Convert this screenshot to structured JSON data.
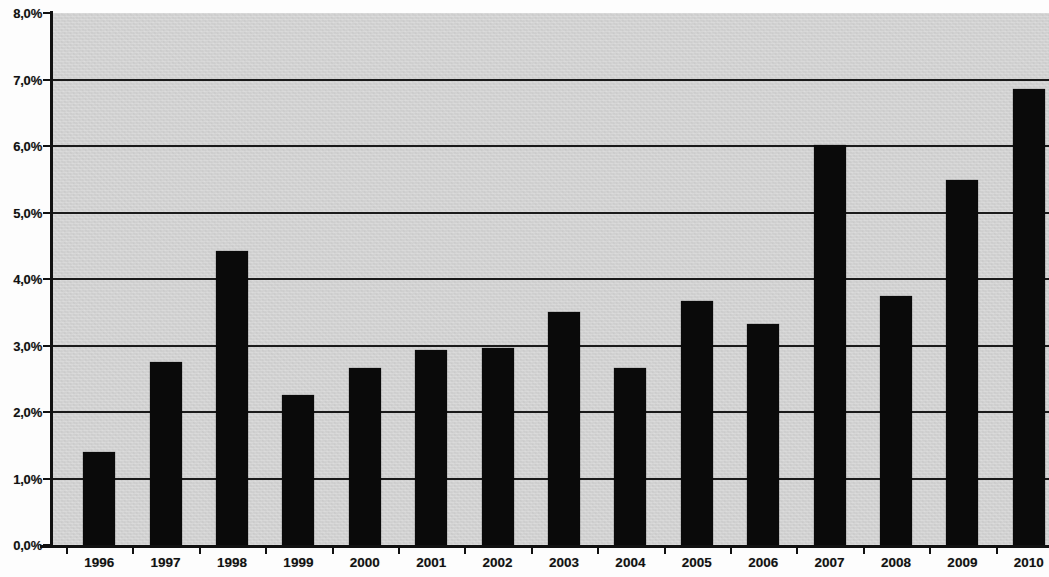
{
  "chart_data": {
    "type": "bar",
    "title": "",
    "subtitle": "",
    "xlabel": "",
    "ylabel": "",
    "categories": [
      "1996",
      "1997",
      "1998",
      "1999",
      "2000",
      "2001",
      "2002",
      "2003",
      "2004",
      "2005",
      "2006",
      "2007",
      "2008",
      "2009",
      "2010"
    ],
    "values": [
      1.4,
      2.75,
      4.42,
      2.26,
      2.66,
      2.93,
      2.96,
      3.5,
      2.66,
      3.67,
      3.32,
      6.02,
      3.74,
      5.49,
      6.86
    ],
    "value_labels": [
      "1,4%",
      "2,8%",
      "4,4%",
      "2,3%",
      "2,7%",
      "2,9%",
      "3,0%",
      "3,5%",
      "2,7%",
      "3,7%",
      "3,3%",
      "6,0%",
      "3,7%",
      "5,5%",
      "6,9%"
    ],
    "ylim": [
      0.0,
      8.0
    ],
    "ytick_values": [
      0.0,
      1.0,
      2.0,
      3.0,
      4.0,
      5.0,
      6.0,
      7.0,
      8.0
    ],
    "ytick_labels": [
      "0,0%",
      "1,0%",
      "2,0%",
      "3,0%",
      "4,0%",
      "5,0%",
      "6,0%",
      "7,0%",
      "8,0%"
    ],
    "grid": true,
    "grid_axis": "y",
    "legend": false,
    "legend_position": "none",
    "series": [
      {
        "name": "",
        "values": [
          1.4,
          2.75,
          4.42,
          2.26,
          2.66,
          2.93,
          2.96,
          3.5,
          2.66,
          3.67,
          3.32,
          6.02,
          3.74,
          5.49,
          6.86
        ]
      }
    ],
    "colors": {
      "bar": "#0a0a0a",
      "plot_background": "#d2d2d2",
      "gridline": "#1a1a1a",
      "axis": "#111111",
      "text": "#111111",
      "figure_background": "#fdfdfd"
    }
  }
}
